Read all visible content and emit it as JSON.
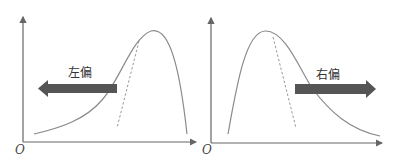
{
  "diagram": {
    "type": "skewness-comparison",
    "panels": [
      {
        "id": "left",
        "label": "左偏",
        "origin_label": "O",
        "arrow_direction": "left",
        "description": "negatively skewed distribution curve with dashed symmetric reference"
      },
      {
        "id": "right",
        "label": "右偏",
        "origin_label": "O",
        "arrow_direction": "right",
        "description": "positively skewed distribution curve with dashed symmetric reference"
      }
    ],
    "colors": {
      "axis": "#666666",
      "curve": "#8a8a8a",
      "dashed": "#9a9a9a",
      "arrow": "#555555",
      "text": "#333333"
    }
  }
}
